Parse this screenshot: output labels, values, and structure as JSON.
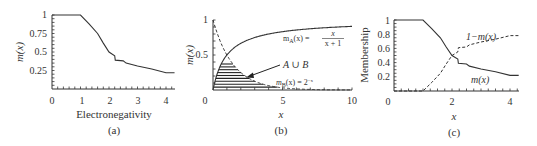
{
  "chart_data": [
    {
      "id": "a",
      "type": "line",
      "caption": "(a)",
      "xlabel": "Electronegativity",
      "ylabel": "m(x)",
      "xlim": [
        0,
        4.3
      ],
      "ylim": [
        0,
        1
      ],
      "xticks": [
        0,
        1,
        2,
        3,
        4
      ],
      "yticks": [
        0.25,
        0.5,
        0.75,
        1
      ],
      "ytick_labels": [
        "0.25",
        "0.5",
        "0.75",
        "1"
      ],
      "grid": false,
      "series": [
        {
          "name": "m(x)",
          "style": "solid",
          "x": [
            0.0,
            1.0,
            1.3,
            1.6,
            1.8,
            2.0,
            2.2,
            2.22,
            2.5,
            2.6,
            3.0,
            3.5,
            4.0,
            4.3
          ],
          "y": [
            1.0,
            1.0,
            0.88,
            0.75,
            0.62,
            0.5,
            0.45,
            0.39,
            0.38,
            0.35,
            0.31,
            0.27,
            0.22,
            0.22
          ]
        }
      ]
    },
    {
      "id": "b",
      "type": "line",
      "caption": "(b)",
      "xlabel": "x",
      "ylabel": "m(x)",
      "xlim": [
        0,
        10
      ],
      "ylim": [
        0,
        1
      ],
      "xticks": [
        0,
        5,
        10
      ],
      "yticks": [
        0.5,
        1
      ],
      "ytick_labels": [
        "0.5",
        "1"
      ],
      "grid": false,
      "series": [
        {
          "name": "m_A(x) = x/(x+1)",
          "style": "solid",
          "function": "x/(x+1)"
        },
        {
          "name": "m_B(x) = 2^-x",
          "style": "dashed",
          "function": "2^-x"
        }
      ],
      "shaded_region": "A ∪ B (hatched, horizontal lines, between curves near origin)",
      "annotations": [
        {
          "text": "A ∪ B",
          "arrow": true
        },
        {
          "text": "m_A(x) = x/(x+1)"
        },
        {
          "text": "m_B(x) = 2^-x"
        }
      ]
    },
    {
      "id": "c",
      "type": "line",
      "caption": "(c)",
      "xlabel": "x",
      "ylabel": "Membership",
      "xlim": [
        0,
        4.3
      ],
      "ylim": [
        0,
        1
      ],
      "xticks": [
        0,
        2,
        4
      ],
      "yticks": [
        0.2,
        0.4,
        0.6,
        0.8,
        1
      ],
      "ytick_labels": [
        "0.2",
        "0.4",
        "0.6",
        "0.8",
        "1"
      ],
      "grid": false,
      "series": [
        {
          "name": "m(x)",
          "style": "solid",
          "x": [
            0.0,
            1.0,
            1.3,
            1.6,
            1.8,
            2.0,
            2.2,
            2.22,
            2.5,
            2.6,
            3.0,
            3.5,
            4.0,
            4.3
          ],
          "y": [
            1.0,
            1.0,
            0.88,
            0.75,
            0.62,
            0.5,
            0.45,
            0.39,
            0.38,
            0.35,
            0.31,
            0.27,
            0.22,
            0.22
          ]
        },
        {
          "name": "1-m(x)",
          "style": "dashed",
          "x": [
            0.0,
            1.0,
            1.3,
            1.6,
            1.8,
            2.0,
            2.2,
            2.22,
            2.5,
            2.6,
            3.0,
            3.5,
            4.0,
            4.3
          ],
          "y": [
            0.0,
            0.0,
            0.12,
            0.25,
            0.38,
            0.5,
            0.55,
            0.61,
            0.62,
            0.65,
            0.69,
            0.73,
            0.78,
            0.78
          ]
        }
      ],
      "annotations": [
        {
          "text": "1−m(x)"
        },
        {
          "text": "m(x)"
        }
      ]
    }
  ],
  "labels": {
    "a": {
      "caption": "(a)",
      "xlabel": "Electronegativity",
      "ylabel": "m(x)",
      "xticks": [
        "0",
        "1",
        "2",
        "3",
        "4"
      ],
      "yticks": [
        "1",
        "0.75",
        "0.5",
        "0.25"
      ]
    },
    "b": {
      "caption": "(b)",
      "xlabel": "x",
      "ylabel": "m(x)",
      "xticks": [
        "0",
        "5",
        "10"
      ],
      "yticks": [
        "1",
        "0.5"
      ],
      "ann_union": "A ∪ B",
      "ann_a_lhs": "m",
      "ann_a_sub": "A",
      "ann_a_rhs": "(x) =",
      "ann_a_num": "x",
      "ann_a_den": "x + 1",
      "ann_b_lhs": "m",
      "ann_b_sub": "B",
      "ann_b_rhs": "(x) = 2",
      "ann_b_sup": "−x"
    },
    "c": {
      "caption": "(c)",
      "xlabel": "x",
      "ylabel": "Membership",
      "xticks": [
        "0",
        "2",
        "4"
      ],
      "yticks": [
        "1",
        "0.8",
        "0.6",
        "0.4",
        "0.2"
      ],
      "ann_one_minus": "1−m(x)",
      "ann_m": "m(x)"
    }
  }
}
